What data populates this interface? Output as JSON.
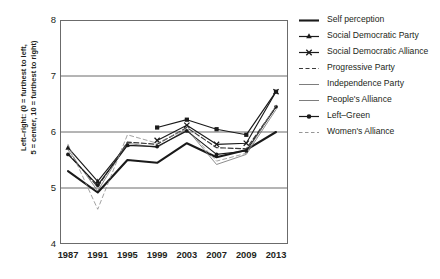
{
  "chart_data": {
    "type": "line",
    "title": "",
    "xlabel": "",
    "ylabel": "Left–right: (0 = furthest to left,\n5 = center, 10 = furthest to right)",
    "x": [
      1987,
      1991,
      1995,
      1999,
      2003,
      2007,
      2009,
      2013
    ],
    "xtick_labels": [
      "1987",
      "1991",
      "1995",
      "1999",
      "2003",
      "2007",
      "2009",
      "2013"
    ],
    "ytick_labels": [
      "8",
      "7",
      "6",
      "5",
      "4"
    ],
    "yticks": [
      8,
      7,
      6,
      5,
      4
    ],
    "ylim": [
      4,
      8
    ],
    "grid": "horizontal",
    "legend_position": "right",
    "series": [
      {
        "name": "Self perception",
        "style": "solid-thick",
        "marker": "none",
        "color": "#1a1a1a",
        "x": [
          1987,
          1991,
          1995,
          1999,
          2003,
          2007,
          2009,
          2013
        ],
        "values": [
          5.3,
          4.92,
          5.5,
          5.45,
          5.8,
          5.55,
          5.68,
          6.0
        ]
      },
      {
        "name": "Social Democratic Party",
        "style": "solid",
        "marker": "triangle",
        "color": "#1a1a1a",
        "x": [
          1987,
          1991,
          1995
        ],
        "values": [
          5.72,
          5.12,
          5.78
        ]
      },
      {
        "name": "Social Democratic Alliance",
        "style": "solid",
        "marker": "x",
        "color": "#1a1a1a",
        "x": [
          1999,
          2003,
          2007,
          2009,
          2013
        ],
        "values": [
          5.85,
          6.12,
          5.78,
          5.8,
          6.72
        ]
      },
      {
        "name": "Progressive Party",
        "style": "dashed",
        "marker": "none",
        "color": "#3a3a3a",
        "x": [
          1987,
          1991,
          1995,
          1999,
          2003,
          2007,
          2009,
          2013
        ],
        "values": [
          5.62,
          5.02,
          5.82,
          5.78,
          6.08,
          5.72,
          5.7,
          6.45
        ]
      },
      {
        "name": "Independence Party",
        "style": "solid",
        "marker": "square",
        "color": "#1a1a1a",
        "x": [
          1999,
          2003,
          2007,
          2009,
          2013
        ],
        "values": [
          6.08,
          6.22,
          6.05,
          5.95,
          6.72
        ]
      },
      {
        "name": "People's Alliance",
        "style": "solid-thin",
        "marker": "none",
        "color": "#6e6e6e",
        "x": [
          1987,
          1991,
          1995,
          1999,
          2003,
          2007,
          2009,
          2013
        ],
        "values": [
          5.68,
          4.95,
          5.8,
          5.72,
          6.05,
          5.42,
          5.6,
          6.4
        ]
      },
      {
        "name": "Left–Green",
        "style": "solid",
        "marker": "dot",
        "color": "#1a1a1a",
        "x": [
          1987,
          1991,
          1995,
          1999,
          2003,
          2007,
          2009,
          2013
        ],
        "values": [
          5.6,
          5.05,
          5.76,
          5.74,
          6.02,
          5.6,
          5.66,
          6.45
        ]
      },
      {
        "name": "Women's Alliance",
        "style": "dashed-thin",
        "marker": "none",
        "color": "#8a8a8a",
        "x": [
          1987,
          1991,
          1995,
          1999,
          2003,
          2007,
          2009,
          2013
        ],
        "values": [
          5.78,
          4.62,
          5.95,
          5.8,
          6.06,
          5.48,
          5.62,
          6.48
        ]
      }
    ]
  },
  "legend": {
    "items": [
      {
        "label": "Self perception",
        "marker": "line"
      },
      {
        "label": "Social Democratic Party",
        "marker": "triangle"
      },
      {
        "label": "Social Democratic Alliance",
        "marker": "x"
      },
      {
        "label": "Progressive Party",
        "marker": "dashed"
      },
      {
        "label": "Independence Party",
        "marker": "thin-line"
      },
      {
        "label": "People's Alliance",
        "marker": "thin-line"
      },
      {
        "label": "Left–Green",
        "marker": "dot"
      },
      {
        "label": "Women's Alliance",
        "marker": "dashed-thin"
      }
    ]
  }
}
